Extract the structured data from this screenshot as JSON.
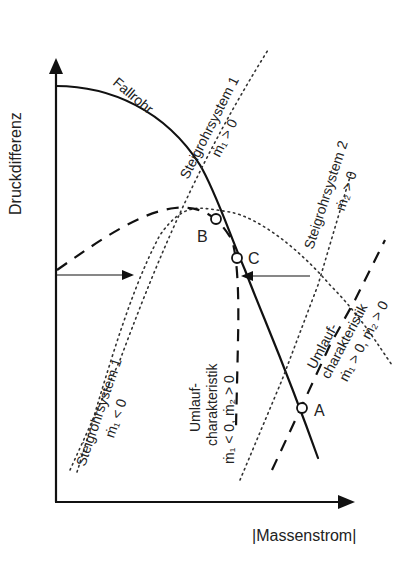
{
  "diagram": {
    "axes": {
      "y_label": "Druckdifferenz",
      "x_label": "|Massenstrom|"
    },
    "curves": {
      "fallrohr": "Fallrohr",
      "steigrohr1_pos": {
        "name": "Steigrohrsystem 1",
        "condition": "ṁ₁ > 0"
      },
      "steigrohr1_neg": {
        "name": "Steigrohrsystem 1",
        "condition": "ṁ₁ < 0"
      },
      "steigrohr2_pos": {
        "name": "Steigrohrsystem 2",
        "condition": "ṁ₂ > 0"
      },
      "umlauf_neg": {
        "line1": "Umlauf-",
        "line2": "charakteristik",
        "condition": "ṁ₁ < 0, ṁ₂ > 0"
      },
      "umlauf_pos": {
        "line1": "Umlauf-",
        "line2": "charakteristik",
        "condition": "ṁ₁ > 0, ṁ₂ > 0"
      }
    },
    "points": {
      "A": "A",
      "B": "B",
      "C": "C"
    },
    "line_styles": {
      "fallrohr": "solid",
      "steigrohr": "dotted",
      "umlauf": "dashed"
    },
    "colors": {
      "stroke": "#111111",
      "background": "#ffffff"
    }
  }
}
